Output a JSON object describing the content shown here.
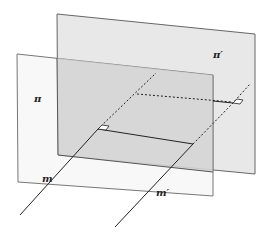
{
  "diagram": {
    "type": "geometry-parallel-planes",
    "labels": {
      "front_plane": "π",
      "back_plane": "π′",
      "line_front": "m",
      "line_back": "m′"
    },
    "colors": {
      "front_plane_fill": "#f0f0f0",
      "back_plane_fill": "#e6e6e6",
      "overlap_fill": "#d4d4d4",
      "stroke": "#555555",
      "line": "#222222"
    }
  }
}
